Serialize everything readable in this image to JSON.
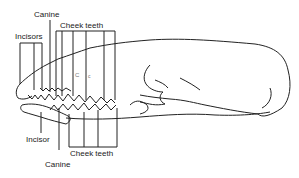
{
  "diagram": {
    "labels": {
      "upper_incisors": "Incisors",
      "upper_canine": "Canine",
      "upper_cheek_teeth": "Cheek teeth",
      "lower_incisor": "Incisor",
      "lower_canine": "Canine",
      "lower_cheek_teeth": "Cheek teeth",
      "mark_C": "C",
      "mark_c": "c"
    },
    "colors": {
      "line": "#222222",
      "background": "#ffffff"
    }
  }
}
